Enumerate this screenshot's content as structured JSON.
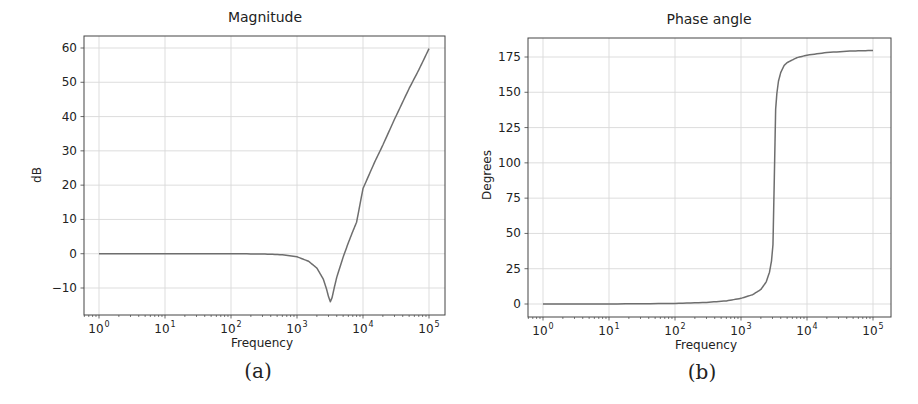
{
  "chart_data": [
    {
      "type": "line",
      "panel_caption": "(a)",
      "title": "Magnitude",
      "xlabel": "Frequency",
      "ylabel": "dB",
      "xscale": "log",
      "xlim": [
        0.6,
        180000
      ],
      "ylim": [
        -18,
        64
      ],
      "grid": true,
      "x_ticks": [
        {
          "base": "10",
          "exp": "0",
          "value": 1
        },
        {
          "base": "10",
          "exp": "1",
          "value": 10
        },
        {
          "base": "10",
          "exp": "2",
          "value": 100
        },
        {
          "base": "10",
          "exp": "3",
          "value": 1000
        },
        {
          "base": "10",
          "exp": "4",
          "value": 10000
        },
        {
          "base": "10",
          "exp": "5",
          "value": 100000
        }
      ],
      "y_ticks": [
        {
          "label": "60",
          "value": 60
        },
        {
          "label": "50",
          "value": 50
        },
        {
          "label": "40",
          "value": 40
        },
        {
          "label": "30",
          "value": 30
        },
        {
          "label": "20",
          "value": 20
        },
        {
          "label": "10",
          "value": 10
        },
        {
          "label": "0",
          "value": 0
        },
        {
          "label": "−10",
          "value": -10
        }
      ],
      "line_color": "#6e6e6e",
      "series": [
        {
          "name": "magnitude",
          "x": [
            1,
            10,
            100,
            300,
            600,
            1000,
            1500,
            2000,
            2500,
            2800,
            3000,
            3200,
            3400,
            3700,
            4000,
            5000,
            6000,
            7000,
            8000,
            10000,
            15000,
            20000,
            30000,
            50000,
            70000,
            100000
          ],
          "y": [
            0.0,
            0.0,
            -0.01,
            -0.08,
            -0.3,
            -0.9,
            -2.2,
            -4.2,
            -7.4,
            -10.3,
            -12.5,
            -14.0,
            -12.8,
            -9.6,
            -6.9,
            -1.0,
            3.2,
            6.5,
            9.2,
            19.0,
            26.7,
            31.7,
            39.2,
            48.2,
            53.6,
            59.8
          ]
        }
      ]
    },
    {
      "type": "line",
      "panel_caption": "(b)",
      "title": "Phase angle",
      "xlabel": "Frequency",
      "ylabel": "Degrees",
      "xscale": "log",
      "xlim": [
        0.6,
        180000
      ],
      "ylim": [
        -9,
        188
      ],
      "grid": true,
      "x_ticks": [
        {
          "base": "10",
          "exp": "0",
          "value": 1
        },
        {
          "base": "10",
          "exp": "1",
          "value": 10
        },
        {
          "base": "10",
          "exp": "2",
          "value": 100
        },
        {
          "base": "10",
          "exp": "3",
          "value": 1000
        },
        {
          "base": "10",
          "exp": "4",
          "value": 10000
        },
        {
          "base": "10",
          "exp": "5",
          "value": 100000
        }
      ],
      "y_ticks": [
        {
          "label": "175",
          "value": 175
        },
        {
          "label": "150",
          "value": 150
        },
        {
          "label": "125",
          "value": 125
        },
        {
          "label": "100",
          "value": 100
        },
        {
          "label": "75",
          "value": 75
        },
        {
          "label": "50",
          "value": 50
        },
        {
          "label": "25",
          "value": 25
        },
        {
          "label": "0",
          "value": 0
        }
      ],
      "line_color": "#6e6e6e",
      "series": [
        {
          "name": "phase",
          "x": [
            1,
            10,
            100,
            300,
            600,
            1000,
            1500,
            2000,
            2400,
            2700,
            2900,
            3050,
            3200,
            3350,
            3500,
            3700,
            4000,
            4500,
            5000,
            7000,
            10000,
            20000,
            50000,
            100000
          ],
          "y": [
            0.0,
            0.04,
            0.4,
            1.1,
            2.2,
            4.0,
            6.6,
            10.3,
            15.5,
            22.4,
            30.6,
            42.0,
            90.0,
            138.0,
            149.5,
            158.0,
            164.0,
            169.0,
            171.0,
            174.5,
            176.3,
            178.2,
            179.3,
            179.6
          ]
        }
      ]
    }
  ]
}
